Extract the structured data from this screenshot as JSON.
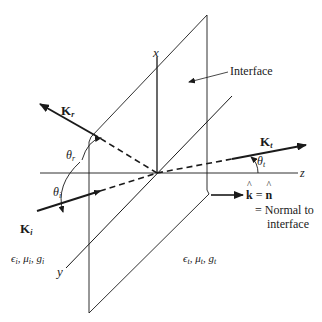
{
  "diagram": {
    "type": "oblique plane-wave incidence at an interface (3D axes)",
    "axes": {
      "x": "x",
      "y": "y",
      "z": "z"
    },
    "plane_label": "Interface",
    "vectors": {
      "incident": {
        "name": "K",
        "subscript": "i"
      },
      "reflected": {
        "name": "K",
        "subscript": "r"
      },
      "transmitted": {
        "name": "K",
        "subscript": "t"
      }
    },
    "angles": {
      "incident": {
        "symbol": "θ",
        "subscript": "i"
      },
      "reflected": {
        "symbol": "θ",
        "subscript": "r"
      },
      "transmitted": {
        "symbol": "θ",
        "subscript": "t"
      }
    },
    "normal_note": {
      "line1_k": "k",
      "line1_eq": " = ",
      "line1_n": "n",
      "line2": "= Normal to",
      "line3": "interface"
    },
    "media": {
      "incident_side": "ϵi, μi, gi",
      "incident_parts": [
        "ϵ",
        "i",
        ", μ",
        "i",
        ", g",
        "i"
      ],
      "transmitted_side": "ϵt, μt, gt",
      "transmitted_parts": [
        "ϵ",
        "t",
        ", μ",
        "t",
        ", g",
        "t"
      ]
    },
    "colors": {
      "ink": "#1a1a1a",
      "background": "#ffffff"
    }
  }
}
